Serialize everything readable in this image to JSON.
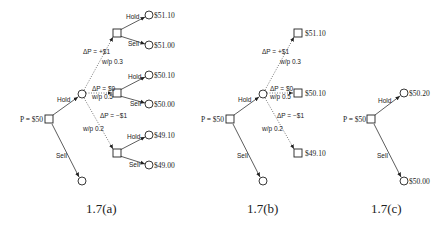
{
  "figures": [
    {
      "caption": "1.7(a)",
      "root_label": "P = $50",
      "hold_label": "Hold",
      "sell_label": "Sell",
      "branches": [
        {
          "delta_label": "ΔP = +$1",
          "prob_label": "w/p 0.3",
          "hold_label": "Hold",
          "sell_label": "Sell",
          "hold_value": "$51.10",
          "sell_value": "$51.00"
        },
        {
          "delta_label": "ΔP = $0",
          "prob_label": "w/p 0.5",
          "hold_label": "Hold",
          "sell_label": "Sell",
          "hold_value": "$50.10",
          "sell_value": "$50.00"
        },
        {
          "delta_label": "ΔP = −$1",
          "prob_label": "w/p 0.2",
          "hold_label": "Hold",
          "sell_label": "Sell",
          "hold_value": "$49.10",
          "sell_value": "$49.00"
        }
      ]
    },
    {
      "caption": "1.7(b)",
      "root_label": "P = $50",
      "hold_label": "Hold",
      "sell_label": "Sell",
      "branches": [
        {
          "delta_label": "ΔP = +$1",
          "prob_label": "w/p 0.3",
          "value": "$51.10"
        },
        {
          "delta_label": "ΔP = $0",
          "prob_label": "w/p 0.5",
          "value": "$50.10"
        },
        {
          "delta_label": "ΔP = −$1",
          "prob_label": "w/p 0.2",
          "value": "$49.10"
        }
      ]
    },
    {
      "caption": "1.7(c)",
      "root_label": "P = $50",
      "hold_label": "Hold",
      "sell_label": "Sell",
      "hold_value": "$50.20",
      "sell_value": "$50.00"
    }
  ]
}
